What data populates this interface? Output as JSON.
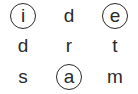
{
  "puzzle": {
    "type": "letter-grid",
    "rows": 3,
    "cols": 3,
    "cells": [
      {
        "letter": "i",
        "circled": true
      },
      {
        "letter": "d",
        "circled": false
      },
      {
        "letter": "e",
        "circled": true
      },
      {
        "letter": "d",
        "circled": false
      },
      {
        "letter": "r",
        "circled": false
      },
      {
        "letter": "t",
        "circled": false
      },
      {
        "letter": "s",
        "circled": false
      },
      {
        "letter": "a",
        "circled": true
      },
      {
        "letter": "m",
        "circled": false
      }
    ]
  }
}
